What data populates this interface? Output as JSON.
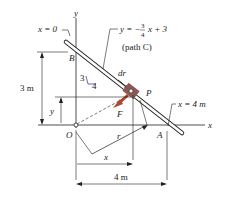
{
  "labels": {
    "x0": "x = 0",
    "y_axis": "y",
    "x_axis": "x",
    "equation_lhs": "y = −",
    "equation_num": "3",
    "equation_den": "4",
    "equation_rhs": "x + 3",
    "path": "(path C)",
    "B": "B",
    "dr": "dr",
    "P": "P",
    "x4": "x = 4 m",
    "three_m": "3 m",
    "y_dim": "y",
    "F": "F",
    "O": "O",
    "r": "r",
    "A": "A",
    "x_dim": "x",
    "four_m": "4 m",
    "slope_rise": "3",
    "slope_run": "4"
  },
  "colors": {
    "force": "#b5452b",
    "collar": "#8a5a52",
    "line": "#222222",
    "handwriting": "#2a2a8a"
  }
}
